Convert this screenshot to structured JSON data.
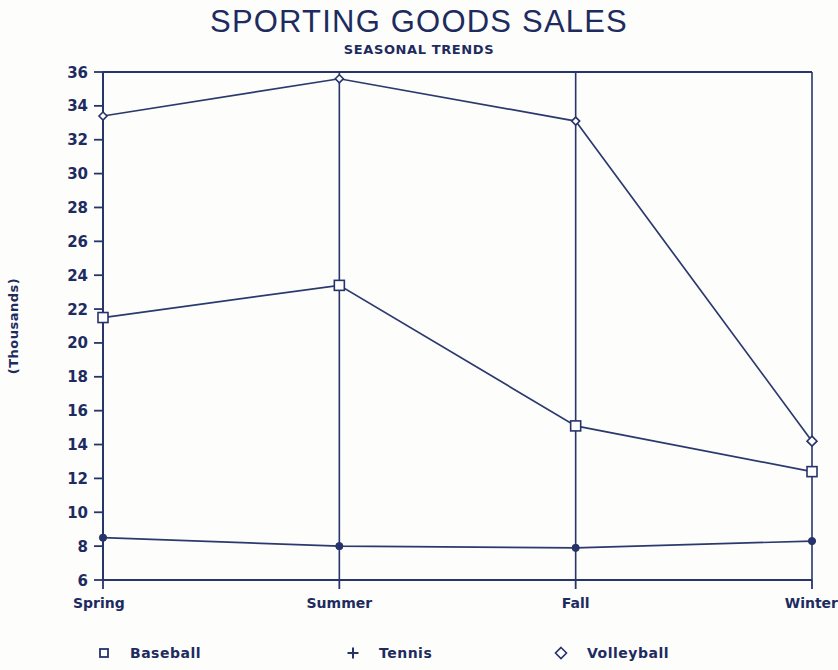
{
  "chart_data": {
    "type": "line",
    "title": "SPORTING GOODS SALES",
    "subtitle": "SEASONAL TRENDS",
    "xlabel": "",
    "ylabel": "(Thousands)",
    "categories": [
      "Spring",
      "Summer",
      "Fall",
      "Winter"
    ],
    "ylim": [
      6,
      36
    ],
    "ytick_step": 2,
    "yticks": [
      6,
      8,
      10,
      12,
      14,
      16,
      18,
      20,
      22,
      24,
      26,
      28,
      30,
      32,
      34,
      36
    ],
    "grid": "vertical-only",
    "legend_position": "bottom",
    "series": [
      {
        "name": "Baseball",
        "marker": "square",
        "values": [
          21.5,
          23.4,
          15.1,
          12.4
        ]
      },
      {
        "name": "Tennis",
        "marker": "plus",
        "values": [
          8.5,
          8.0,
          7.9,
          8.3
        ]
      },
      {
        "name": "Volleyball",
        "marker": "diamond",
        "values": [
          33.4,
          35.6,
          33.1,
          14.2
        ]
      }
    ]
  },
  "axis": {
    "ytick_labels": [
      "36",
      "34",
      "32",
      "30",
      "28",
      "26",
      "24",
      "22",
      "20",
      "18",
      "16",
      "14",
      "12",
      "10",
      "8",
      "6"
    ],
    "xtick_labels": [
      "Spring",
      "Summer",
      "Fall",
      "Winter"
    ]
  },
  "legend": {
    "items": [
      {
        "label": "Baseball",
        "symbol": "square-marker"
      },
      {
        "label": "Tennis",
        "symbol": "plus-marker"
      },
      {
        "label": "Volleyball",
        "symbol": "diamond-marker"
      }
    ]
  },
  "colors": {
    "ink": "#1e2b5e",
    "line": "#2b3a6d",
    "background": "#fdfdfc"
  }
}
